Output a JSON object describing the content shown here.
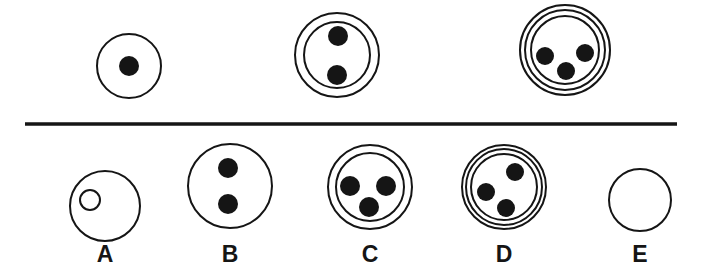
{
  "canvas": {
    "width": 703,
    "height": 276,
    "background": "#ffffff",
    "ink": "#151515"
  },
  "style": {
    "ring_stroke": 2,
    "label_font_size": 23,
    "label_baseline_y": 262
  },
  "divider": {
    "x1": 25,
    "y": 124,
    "x2": 677,
    "thickness": 3.5
  },
  "top_row": [
    {
      "name": "top-figure-1",
      "cx": 129,
      "cy": 66,
      "rings": [
        32
      ],
      "dots": [
        {
          "x": 129,
          "y": 66,
          "r": 10,
          "filled": true
        }
      ]
    },
    {
      "name": "top-figure-2",
      "cx": 337,
      "cy": 55,
      "rings": [
        42,
        33
      ],
      "dots": [
        {
          "x": 338,
          "y": 36,
          "r": 10,
          "filled": true
        },
        {
          "x": 337,
          "y": 75,
          "r": 10,
          "filled": true
        }
      ]
    },
    {
      "name": "top-figure-3",
      "cx": 565,
      "cy": 50,
      "rings": [
        45,
        40,
        34
      ],
      "dots": [
        {
          "x": 545,
          "y": 56,
          "r": 9,
          "filled": true
        },
        {
          "x": 585,
          "y": 53,
          "r": 9,
          "filled": true
        },
        {
          "x": 566,
          "y": 71,
          "r": 9,
          "filled": true
        }
      ]
    }
  ],
  "options": [
    {
      "name": "option-a",
      "label": "A",
      "cx": 105,
      "cy": 206,
      "rings": [
        35
      ],
      "dots": [
        {
          "x": 90,
          "y": 200,
          "r": 10,
          "filled": false
        }
      ]
    },
    {
      "name": "option-b",
      "label": "B",
      "cx": 230,
      "cy": 186,
      "rings": [
        42
      ],
      "dots": [
        {
          "x": 228,
          "y": 168,
          "r": 10,
          "filled": true
        },
        {
          "x": 228,
          "y": 204,
          "r": 10,
          "filled": true
        }
      ]
    },
    {
      "name": "option-c",
      "label": "C",
      "cx": 370,
      "cy": 187,
      "rings": [
        42,
        34
      ],
      "dots": [
        {
          "x": 350,
          "y": 186,
          "r": 10,
          "filled": true
        },
        {
          "x": 386,
          "y": 186,
          "r": 10,
          "filled": true
        },
        {
          "x": 369,
          "y": 207,
          "r": 10,
          "filled": true
        }
      ]
    },
    {
      "name": "option-d",
      "label": "D",
      "cx": 504,
      "cy": 187,
      "rings": [
        42,
        38,
        33
      ],
      "dots": [
        {
          "x": 515,
          "y": 172,
          "r": 9,
          "filled": true
        },
        {
          "x": 486,
          "y": 192,
          "r": 9,
          "filled": true
        },
        {
          "x": 506,
          "y": 208,
          "r": 9,
          "filled": true
        }
      ]
    },
    {
      "name": "option-e",
      "label": "E",
      "cx": 640,
      "cy": 200,
      "rings": [
        31
      ],
      "dots": []
    }
  ]
}
